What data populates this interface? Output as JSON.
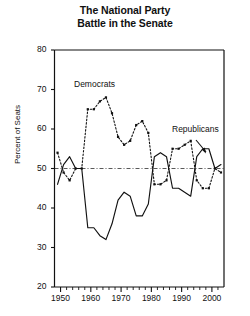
{
  "title": {
    "line1": "The National Party",
    "line2": "Battle in the Senate"
  },
  "axes": {
    "ylabel": "Percent of Seats",
    "xlabel": "",
    "yticks": [
      20,
      30,
      40,
      50,
      60,
      70,
      80
    ],
    "xticks": [
      1950,
      1960,
      1970,
      1980,
      1990,
      2000
    ]
  },
  "annotations": {
    "democrats": "Democrats",
    "republicans": "Republicans"
  },
  "colors": {
    "ink": "#111111",
    "series": "#111111",
    "background": "#ffffff"
  },
  "chart_data": {
    "type": "line",
    "title": "The National Party Battle in the Senate",
    "xlabel": "",
    "ylabel": "Percent of Seats",
    "xlim": [
      1948,
      2004
    ],
    "ylim": [
      20,
      80
    ],
    "grid": false,
    "legend": "inline-annotations",
    "reference_line": {
      "y": 50,
      "style": "dash-dot"
    },
    "x": [
      1949,
      1951,
      1953,
      1955,
      1957,
      1959,
      1961,
      1963,
      1965,
      1967,
      1969,
      1971,
      1973,
      1975,
      1977,
      1979,
      1981,
      1983,
      1985,
      1987,
      1989,
      1991,
      1993,
      1995,
      1997,
      1999,
      2001,
      2003
    ],
    "series": [
      {
        "name": "Democrats",
        "style": "dotted",
        "marker": "square",
        "values": [
          54,
          49,
          47,
          50,
          50,
          65,
          65,
          67,
          68,
          64,
          58,
          56,
          57,
          61,
          62,
          59,
          46,
          46,
          47,
          55,
          55,
          56,
          57,
          47,
          45,
          45,
          50,
          49
        ]
      },
      {
        "name": "Republicans",
        "style": "solid",
        "marker": "none",
        "values": [
          46,
          51,
          53,
          50,
          50,
          35,
          35,
          33,
          32,
          36,
          42,
          44,
          43,
          38,
          38,
          41,
          53,
          54,
          53,
          45,
          45,
          44,
          43,
          53,
          55,
          55,
          50,
          51
        ]
      }
    ]
  }
}
